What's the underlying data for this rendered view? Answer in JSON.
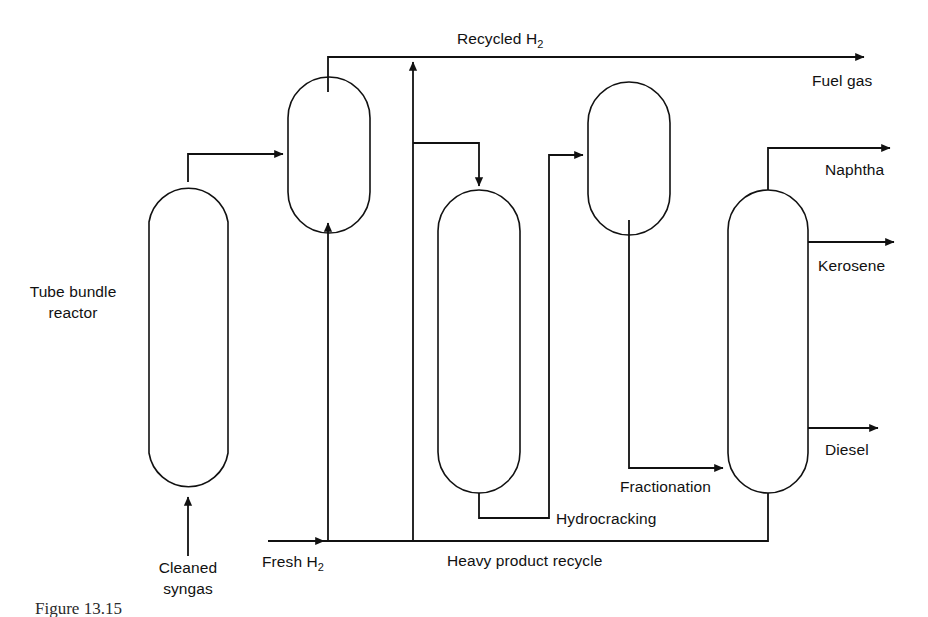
{
  "figure": {
    "type": "process-flow-diagram",
    "title_partial": "Figure 13.15",
    "background_color": "#ffffff",
    "line_color": "#111111"
  },
  "labels": {
    "reactor_line1": "Tube bundle",
    "reactor_line2": "reactor",
    "cleaned_syngas_line1": "Cleaned",
    "cleaned_syngas_line2": "syngas",
    "fresh_h2": "Fresh H",
    "fresh_h2_sub": "2",
    "recycled_h2": "Recycled H",
    "recycled_h2_sub": "2",
    "fuel_gas": "Fuel gas",
    "naphtha": "Naphtha",
    "kerosene": "Kerosene",
    "diesel": "Diesel",
    "hydrocracking": "Hydrocracking",
    "fractionation": "Fractionation",
    "heavy_product_recycle": "Heavy product recycle"
  },
  "equipment": [
    {
      "id": "tube-bundle-reactor",
      "name": "Tube bundle reactor",
      "x": 149,
      "y": 182,
      "w": 79,
      "h": 311,
      "radius_top": 40,
      "radius_bottom": 40
    },
    {
      "id": "separator-vessel",
      "name": "Separator vessel",
      "x": 288,
      "y": 92,
      "w": 82,
      "h": 126,
      "radius_top": 26,
      "radius_bottom": 26
    },
    {
      "id": "hydrocracking-reactor",
      "name": "Hydrocracking reactor",
      "x": 438,
      "y": 190,
      "w": 82,
      "h": 303,
      "radius_top": 41,
      "radius_bottom": 41
    },
    {
      "id": "hydrocracker-separator",
      "name": "Hydrocracker separator",
      "x": 588,
      "y": 97,
      "w": 82,
      "h": 123,
      "radius_top": 26,
      "radius_bottom": 26
    },
    {
      "id": "fractionation-column",
      "name": "Fractionation column",
      "x": 728,
      "y": 190,
      "w": 80,
      "h": 303,
      "radius_top": 40,
      "radius_bottom": 40
    }
  ],
  "streams": [
    {
      "id": "cleaned-syngas-feed",
      "label": "Cleaned syngas",
      "from": "feed",
      "to": "tube-bundle-reactor"
    },
    {
      "id": "reactor-to-separator",
      "label": "",
      "from": "tube-bundle-reactor",
      "to": "separator-vessel"
    },
    {
      "id": "fresh-h2-feed",
      "label": "Fresh H2",
      "from": "feed",
      "to": "separator-vessel"
    },
    {
      "id": "recycled-h2-overhead",
      "label": "Recycled H2",
      "from": "separator-vessel",
      "to": "fuel-gas"
    },
    {
      "id": "fuel-gas-product",
      "label": "Fuel gas",
      "from": "separator-vessel",
      "to": "product"
    },
    {
      "id": "separator-liquid-to-hydrocracker",
      "label": "",
      "from": "separator-vessel",
      "to": "hydrocracking-reactor"
    },
    {
      "id": "hydrocracker-to-separator2",
      "label": "",
      "from": "hydrocracking-reactor",
      "to": "hydrocracker-separator"
    },
    {
      "id": "separator2-to-fractionation",
      "label": "Fractionation",
      "from": "hydrocracker-separator",
      "to": "fractionation-column"
    },
    {
      "id": "naphtha-product",
      "label": "Naphtha",
      "from": "fractionation-column",
      "to": "product"
    },
    {
      "id": "kerosene-product",
      "label": "Kerosene",
      "from": "fractionation-column",
      "to": "product"
    },
    {
      "id": "diesel-product",
      "label": "Diesel",
      "from": "fractionation-column",
      "to": "product"
    },
    {
      "id": "heavy-product-recycle",
      "label": "Heavy product recycle",
      "from": "fractionation-column",
      "to": "separator-vessel"
    }
  ]
}
